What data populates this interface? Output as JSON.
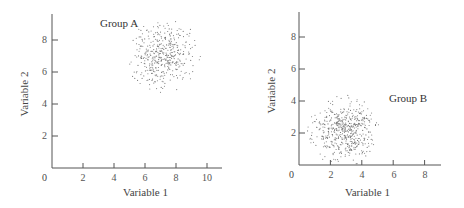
{
  "chart_data": [
    {
      "type": "scatter",
      "title": "",
      "annotation": "Group A",
      "xlabel": "Variable 1",
      "ylabel": "Variable 2",
      "xlim": [
        0,
        11
      ],
      "ylim": [
        0,
        9.5
      ],
      "x_ticks": [
        2,
        4,
        6,
        8,
        10
      ],
      "x_tick_labels": [
        "2",
        "4",
        "6",
        "8",
        "10"
      ],
      "y_ticks": [
        2,
        4,
        6,
        8
      ],
      "y_tick_labels": [
        "2",
        "4",
        "6",
        "8"
      ],
      "origin_label": "0",
      "grid": false,
      "legend": "none",
      "cluster": {
        "center_x": 7.2,
        "center_y": 7.0,
        "spread_x": 1.0,
        "spread_y": 1.0,
        "radius": 2.4,
        "n_points": 420
      }
    },
    {
      "type": "scatter",
      "title": "",
      "annotation": "Group B",
      "xlabel": "Variable 1",
      "ylabel": "Variable 2",
      "xlim": [
        0,
        9
      ],
      "ylim": [
        0,
        9.5
      ],
      "x_ticks": [
        2,
        4,
        6,
        8
      ],
      "x_tick_labels": [
        "2",
        "4",
        "6",
        "8"
      ],
      "y_ticks": [
        2,
        4,
        6,
        8
      ],
      "y_tick_labels": [
        "2",
        "4",
        "6",
        "8"
      ],
      "origin_label": "0",
      "grid": false,
      "legend": "none",
      "cluster": {
        "center_x": 2.8,
        "center_y": 2.1,
        "spread_x": 1.0,
        "spread_y": 0.9,
        "radius": 2.3,
        "n_points": 520
      }
    }
  ],
  "panels": [
    {
      "group_label": "Group A",
      "xlabel": "Variable 1",
      "ylabel": "Variable 2",
      "origin": "0",
      "xticks": [
        "2",
        "4",
        "6",
        "8",
        "10"
      ],
      "yticks": [
        "2",
        "4",
        "6",
        "8"
      ]
    },
    {
      "group_label": "Group B",
      "xlabel": "Variable 1",
      "ylabel": "Variable 2",
      "origin": "0",
      "xticks": [
        "2",
        "4",
        "6",
        "8"
      ],
      "yticks": [
        "2",
        "4",
        "6",
        "8"
      ]
    }
  ],
  "colors": {
    "axis": "#555555",
    "points": "#777777",
    "text": "#333333"
  }
}
